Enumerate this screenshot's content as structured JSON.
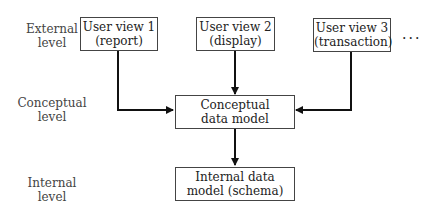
{
  "levels": {
    "external": [
      "External",
      "level"
    ],
    "conceptual": [
      "Conceptual",
      "level"
    ],
    "internal": [
      "Internal",
      "level"
    ]
  },
  "views": [
    {
      "line1": "User view 1",
      "line2": "(report)"
    },
    {
      "line1": "User view 2",
      "line2": "(display)"
    },
    {
      "line1": "User view 3",
      "line2": "(transaction)"
    }
  ],
  "more": "...",
  "conceptual_model": {
    "line1": "Conceptual",
    "line2": "data model"
  },
  "internal_model": {
    "line1": "Internal data",
    "line2": "model (schema)"
  }
}
